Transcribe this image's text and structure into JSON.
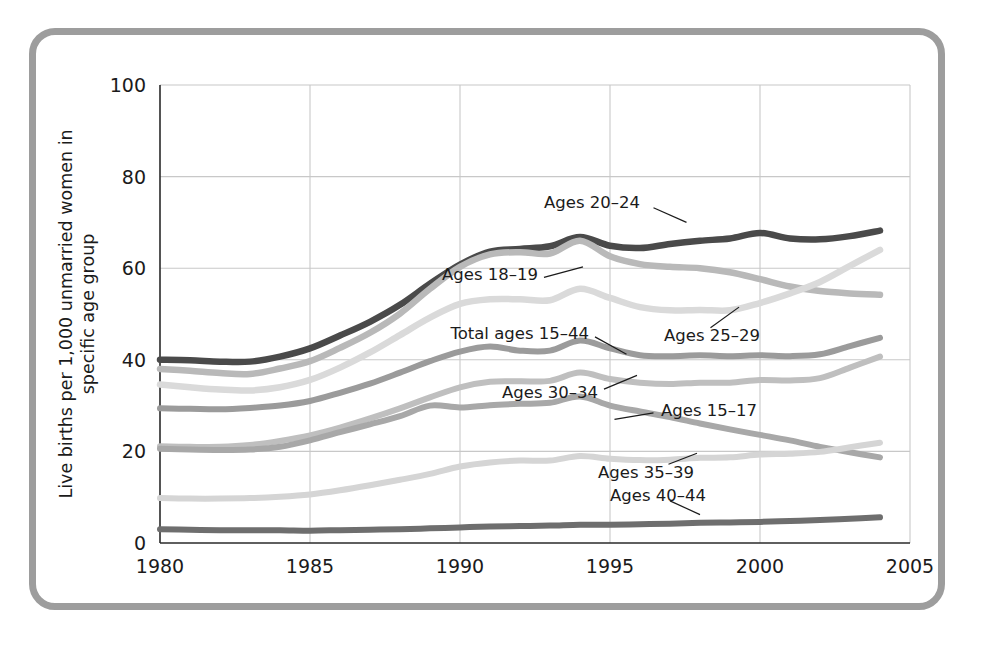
{
  "figure": {
    "frame_color": "#9d9d9d",
    "background": "#ffffff"
  },
  "chart_data": {
    "type": "line",
    "title": "",
    "subtitle": "",
    "xlabel": "",
    "ylabel": "Live births per 1,000 unmarried women in specific age group",
    "xlim": [
      1980,
      2005
    ],
    "ylim": [
      0,
      100
    ],
    "xticks": [
      "1980",
      "1985",
      "1990",
      "1995",
      "2000",
      "2005"
    ],
    "xtick_values": [
      1980,
      1985,
      1990,
      1995,
      2000,
      2005
    ],
    "yticks": [
      "0",
      "20",
      "40",
      "60",
      "80",
      "100"
    ],
    "ytick_values": [
      0,
      20,
      40,
      60,
      80,
      100
    ],
    "grid": "both",
    "legend_position": "inline-annotations",
    "x": [
      1980,
      1981,
      1982,
      1983,
      1984,
      1985,
      1986,
      1987,
      1988,
      1989,
      1990,
      1991,
      1992,
      1993,
      1994,
      1995,
      1996,
      1997,
      1998,
      1999,
      2000,
      2001,
      2002,
      2003,
      2004
    ],
    "series": [
      {
        "name": "Ages 20-24",
        "label": "Ages 20–24",
        "color": "#4a4a4a",
        "width": 6.5,
        "label_x": 1996.0,
        "label_y": 74.5,
        "anchor": "end",
        "leader": [
          [
            1996.45,
            73.2
          ],
          [
            1997.55,
            70.0
          ]
        ],
        "values": [
          40.0,
          39.9,
          39.6,
          39.6,
          40.7,
          42.5,
          45.3,
          48.3,
          52.0,
          56.6,
          60.8,
          63.6,
          64.2,
          64.8,
          66.8,
          64.9,
          64.4,
          65.3,
          66.0,
          66.5,
          67.7,
          66.5,
          66.3,
          67.0,
          68.2
        ]
      },
      {
        "name": "Ages 18-19",
        "label": "Ages 18–19",
        "color": "#b9b9b9",
        "width": 6.5,
        "label_x": 1992.6,
        "label_y": 58.8,
        "anchor": "end",
        "leader": [
          [
            1992.8,
            58.0
          ],
          [
            1994.1,
            60.3
          ]
        ],
        "values": [
          38.0,
          37.6,
          37.1,
          36.9,
          38.1,
          39.7,
          42.6,
          45.9,
          50.1,
          55.5,
          60.3,
          63.0,
          63.5,
          63.2,
          66.0,
          62.6,
          60.9,
          60.3,
          60.0,
          59.1,
          57.6,
          56.0,
          55.0,
          54.5,
          54.2
        ]
      },
      {
        "name": "Ages 25-29",
        "label": "Ages 25–29",
        "color": "#dadada",
        "width": 6.5,
        "label_x": 1996.8,
        "label_y": 45.5,
        "anchor": "start",
        "leader": [
          [
            1998.35,
            47.0
          ],
          [
            1999.3,
            51.5
          ]
        ],
        "values": [
          34.6,
          34.0,
          33.5,
          33.3,
          34.0,
          35.6,
          38.3,
          41.6,
          45.4,
          49.2,
          52.2,
          53.2,
          53.2,
          53.0,
          55.5,
          53.5,
          51.5,
          50.8,
          50.9,
          50.8,
          52.4,
          54.5,
          57.0,
          60.5,
          64.0
        ]
      },
      {
        "name": "Total ages 15-44",
        "label": "Total ages 15–44",
        "color": "#9b9b9b",
        "width": 6.0,
        "label_x": 1994.3,
        "label_y": 45.8,
        "anchor": "end",
        "leader": [
          [
            1994.5,
            45.0
          ],
          [
            1995.55,
            41.2
          ]
        ],
        "values": [
          29.4,
          29.3,
          29.2,
          29.5,
          30.0,
          31.0,
          32.8,
          34.8,
          37.2,
          39.7,
          41.8,
          42.9,
          42.0,
          42.0,
          44.2,
          42.5,
          41.0,
          40.8,
          41.0,
          40.8,
          41.0,
          40.8,
          41.2,
          43.0,
          44.8
        ]
      },
      {
        "name": "Ages 30-34",
        "label": "Ages 30–34",
        "color": "#bfbfbf",
        "width": 6.0,
        "label_x": 1994.6,
        "label_y": 33.0,
        "anchor": "end",
        "leader": [
          [
            1994.8,
            33.6
          ],
          [
            1995.9,
            36.6
          ]
        ],
        "values": [
          21.1,
          21.0,
          21.0,
          21.4,
          22.3,
          23.5,
          25.2,
          27.2,
          29.4,
          31.8,
          34.0,
          35.2,
          35.3,
          35.4,
          37.2,
          35.8,
          35.0,
          34.7,
          35.0,
          35.0,
          35.6,
          35.5,
          36.0,
          38.3,
          40.7
        ]
      },
      {
        "name": "Ages 15-17",
        "label": "Ages 15–17",
        "color": "#a8a8a8",
        "width": 6.0,
        "label_x": 1996.7,
        "label_y": 29.0,
        "anchor": "start",
        "leader": [
          [
            1995.15,
            27.0
          ],
          [
            1996.45,
            28.4
          ]
        ],
        "values": [
          20.6,
          20.4,
          20.3,
          20.4,
          21.0,
          22.4,
          24.2,
          25.9,
          27.7,
          30.0,
          29.6,
          30.1,
          30.4,
          30.6,
          32.0,
          30.0,
          28.7,
          27.5,
          26.1,
          24.8,
          23.6,
          22.4,
          21.0,
          19.8,
          18.7
        ]
      },
      {
        "name": "Ages 35-39",
        "label": "Ages 35–39",
        "color": "#d5d5d5",
        "width": 6.0,
        "label_x": 1994.6,
        "label_y": 15.4,
        "anchor": "start",
        "leader": [
          [
            1996.95,
            17.2
          ],
          [
            1997.9,
            19.6
          ]
        ],
        "values": [
          9.8,
          9.7,
          9.7,
          9.8,
          10.1,
          10.6,
          11.5,
          12.6,
          13.8,
          15.1,
          16.7,
          17.6,
          18.0,
          18.0,
          19.0,
          18.4,
          18.1,
          18.2,
          18.6,
          18.7,
          19.3,
          19.5,
          19.9,
          20.9,
          21.9
        ]
      },
      {
        "name": "Ages 40-44",
        "label": "Ages 40–44",
        "color": "#6e6e6e",
        "width": 6.0,
        "label_x": 1995.0,
        "label_y": 10.4,
        "anchor": "start",
        "leader": [
          [
            1997.0,
            9.2
          ],
          [
            1998.0,
            6.2
          ]
        ],
        "values": [
          3.0,
          2.9,
          2.8,
          2.8,
          2.8,
          2.7,
          2.8,
          2.9,
          3.0,
          3.2,
          3.4,
          3.6,
          3.7,
          3.8,
          4.0,
          4.0,
          4.1,
          4.2,
          4.4,
          4.5,
          4.6,
          4.8,
          5.0,
          5.3,
          5.6
        ]
      }
    ]
  }
}
